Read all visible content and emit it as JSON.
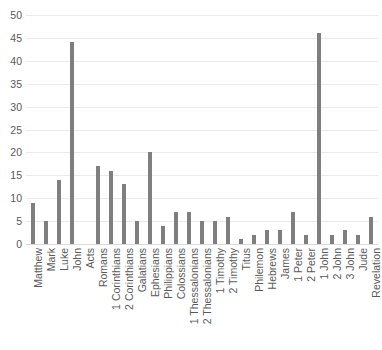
{
  "chart_data": {
    "type": "bar",
    "title": "",
    "xlabel": "",
    "ylabel": "",
    "ylim": [
      0,
      50
    ],
    "yticks": [
      0,
      5,
      10,
      15,
      20,
      25,
      30,
      35,
      40,
      45,
      50
    ],
    "grid": true,
    "legend": "none",
    "bar_color": "#7f7f7f",
    "categories": [
      "Matthew",
      "Mark",
      "Luke",
      "John",
      "Acts",
      "Romans",
      "1 Corinthians",
      "2 Corinthians",
      "Galatians",
      "Ephesians",
      "Philippians",
      "Colossians",
      "1 Thessalonians",
      "2 Thessalonians",
      "1 Timothy",
      "2 Timothy",
      "Titus",
      "Philemon",
      "Hebrews",
      "James",
      "1 Peter",
      "2 Peter",
      "1 John",
      "2 John",
      "3 John",
      "Jude",
      "Revelation"
    ],
    "values": [
      9,
      5,
      14,
      44,
      0,
      17,
      16,
      13,
      5,
      20,
      4,
      7,
      7,
      5,
      5,
      6,
      1,
      2,
      3,
      3,
      7,
      2,
      46,
      2,
      3,
      2,
      6
    ]
  }
}
